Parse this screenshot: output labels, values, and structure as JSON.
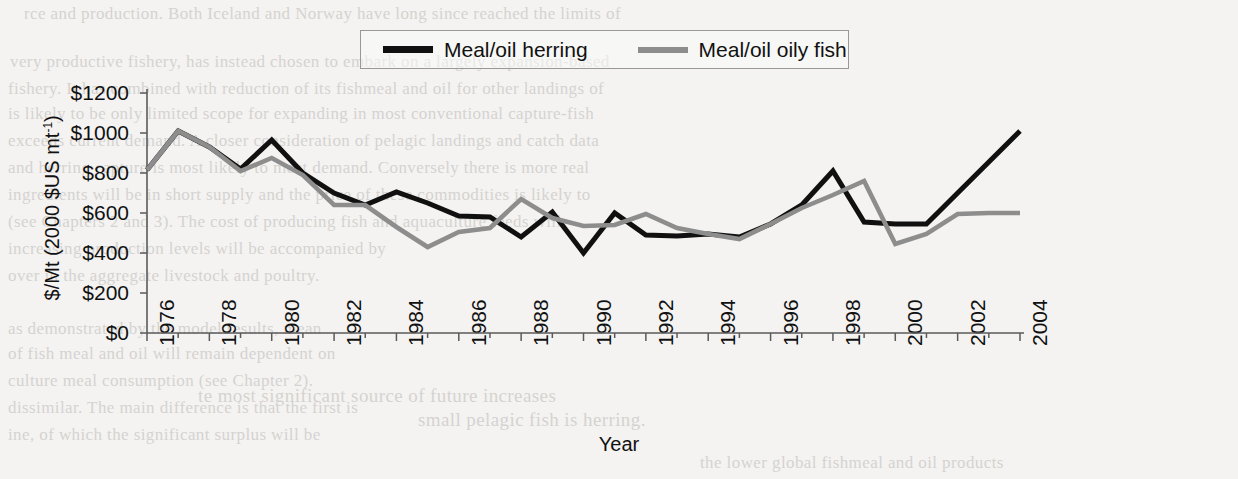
{
  "figure": {
    "kind": "line-chart",
    "legend": {
      "entries": [
        {
          "label": "Meal/oil herring",
          "color": "#101010"
        },
        {
          "label": "Meal/oil oily fish",
          "color": "#8d8d8d"
        }
      ]
    }
  },
  "chart_data": {
    "type": "line",
    "title": "",
    "xlabel": "Year",
    "ylabel": "$/Mt (2000 $US mt-1)",
    "ylabel_rich": "$/Mt (2000 $US mt⁻¹)",
    "xlim": [
      1976,
      2004
    ],
    "ylim": [
      0,
      1200
    ],
    "ytick_labels": [
      "$1200",
      "$1000",
      "$800",
      "$600",
      "$400",
      "$200",
      "$0"
    ],
    "yticks": [
      1200,
      1000,
      800,
      600,
      400,
      200,
      0
    ],
    "xtick_labels": [
      "1976",
      "1978",
      "1980",
      "1982",
      "1984",
      "1986",
      "1988",
      "1990",
      "1992",
      "1994",
      "1996",
      "1998",
      "2000",
      "2002",
      "2004"
    ],
    "xticks": [
      1976,
      1978,
      1980,
      1982,
      1984,
      1986,
      1988,
      1990,
      1992,
      1994,
      1996,
      1998,
      2000,
      2002,
      2004
    ],
    "minor_xticks_every": 1,
    "grid": false,
    "legend_position": "top-center",
    "x": [
      1976,
      1977,
      1978,
      1979,
      1980,
      1981,
      1982,
      1983,
      1984,
      1985,
      1986,
      1987,
      1988,
      1989,
      1990,
      1991,
      1992,
      1993,
      1994,
      1995,
      1996,
      1997,
      1998,
      1999,
      2000,
      2001,
      2002,
      2003,
      2004
    ],
    "series": [
      {
        "name": "Meal/oil herring",
        "color": "#101010",
        "values": [
          815,
          1010,
          930,
          820,
          965,
          800,
          700,
          640,
          705,
          650,
          585,
          580,
          480,
          605,
          400,
          600,
          490,
          485,
          495,
          480,
          545,
          640,
          810,
          555,
          545,
          545,
          700,
          855,
          1010
        ]
      },
      {
        "name": "Meal/oil oily fish",
        "color": "#8d8d8d",
        "values": [
          815,
          1010,
          930,
          810,
          875,
          790,
          640,
          640,
          530,
          430,
          505,
          525,
          670,
          575,
          535,
          540,
          595,
          525,
          495,
          470,
          545,
          625,
          690,
          760,
          445,
          495,
          595,
          600,
          600
        ]
      }
    ]
  },
  "page_background_lines": [
    {
      "text": "rce and production. Both Iceland and Norway have long since reached the limits of",
      "x": 24,
      "y": 4,
      "size": 17
    },
    {
      "text": "very productive fishery, has instead chosen to embark on a largely expansion-based",
      "x": 10,
      "y": 52,
      "size": 17
    },
    {
      "text": "fishery. It has combined with reduction of its fishmeal and oil for other landings of",
      "x": 8,
      "y": 79,
      "size": 17
    },
    {
      "text": "is likely to be only limited scope for expanding in most conventional capture-fish",
      "x": 8,
      "y": 104,
      "size": 17
    },
    {
      "text": "exceeds current demand. A closer consideration of pelagic landings and catch data",
      "x": 8,
      "y": 131,
      "size": 17
    },
    {
      "text": "and herring capture is most likely to meet demand. Conversely there is more real",
      "x": 8,
      "y": 158,
      "size": 17
    },
    {
      "text": "ingredients will be in short supply and the price of these commodities is likely to",
      "x": 8,
      "y": 185,
      "size": 17
    },
    {
      "text": "(see Chapters 2 and 3). The cost of producing fish and aquaculture feeds will",
      "x": 8,
      "y": 212,
      "size": 17
    },
    {
      "text": "increasing production levels will be accompanied by",
      "x": 8,
      "y": 239,
      "size": 17
    },
    {
      "text": "over in the aggregate livestock and poultry.",
      "x": 8,
      "y": 266,
      "size": 17
    },
    {
      "text": "as demonstrated by the model results, mean",
      "x": 8,
      "y": 319,
      "size": 17
    },
    {
      "text": "of fish meal and oil will remain dependent on",
      "x": 8,
      "y": 344,
      "size": 17
    },
    {
      "text": "culture meal consumption (see Chapter 2).",
      "x": 8,
      "y": 371,
      "size": 17
    },
    {
      "text": "dissimilar. The main difference is that the first is",
      "x": 8,
      "y": 398,
      "size": 17
    },
    {
      "text": "ine, of which the significant surplus will be",
      "x": 8,
      "y": 425,
      "size": 17
    },
    {
      "text": "te most significant source of future increases",
      "x": 198,
      "y": 385,
      "size": 19
    },
    {
      "text": "small pelagic fish is herring.",
      "x": 418,
      "y": 409,
      "size": 19
    },
    {
      "text": "the lower global fishmeal and oil products",
      "x": 700,
      "y": 453,
      "size": 17
    }
  ]
}
